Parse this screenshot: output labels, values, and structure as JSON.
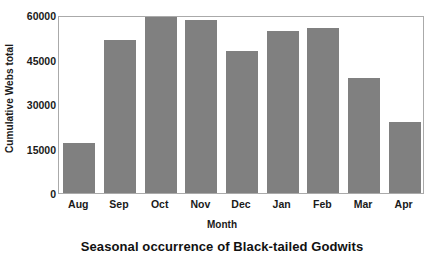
{
  "chart_data": {
    "type": "bar",
    "title": "Seasonal occurrence of Black-tailed Godwits",
    "xlabel": "Month",
    "ylabel": "Cumulative Webs total",
    "categories": [
      "Aug",
      "Sep",
      "Oct",
      "Nov",
      "Dec",
      "Jan",
      "Feb",
      "Mar",
      "Apr"
    ],
    "values": [
      16700,
      51500,
      59300,
      58300,
      48000,
      54500,
      55600,
      38900,
      23900
    ],
    "ylim": [
      0,
      60000
    ],
    "yticks": [
      0,
      15000,
      30000,
      45000,
      60000
    ],
    "ytick_labels": [
      "0",
      "15000",
      "30000",
      "45000",
      "60000"
    ],
    "grid": false,
    "legend": null,
    "series_color": "#808080",
    "plot_border_color": "#aaaaaa",
    "text_color": "#1a1a1a"
  }
}
